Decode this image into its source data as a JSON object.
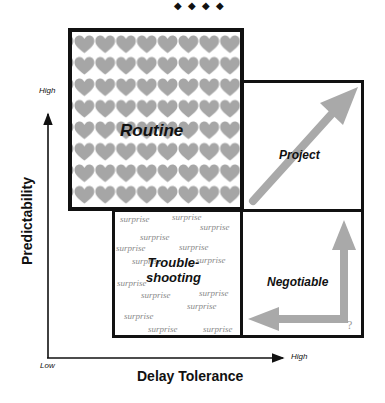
{
  "header": {
    "ornament": "◆◆◆◆"
  },
  "axes": {
    "y": {
      "title": "Predictability",
      "low": "Low",
      "high": "High"
    },
    "x": {
      "title": "Delay Tolerance",
      "low": "Low",
      "high": "High"
    }
  },
  "quadrants": {
    "routine": {
      "label": "Routine",
      "pattern": "hearts",
      "pattern_color": "#a6a6a6"
    },
    "project": {
      "label": "Project",
      "arrow": "diagonal-up-right",
      "arrow_color": "#a9a9a9"
    },
    "troubleshooting": {
      "label_line1": "Trouble-",
      "label_line2": "shooting",
      "pattern_word": "surprise",
      "pattern_count": 16
    },
    "negotiable": {
      "label": "Negotiable",
      "arrow": "bidirectional-up-left",
      "arrow_color": "#a9a9a9",
      "mark": "?"
    }
  },
  "colors": {
    "border": "#111111",
    "pattern": "#a6a6a6",
    "arrow": "#a9a9a9",
    "background": "#ffffff"
  }
}
